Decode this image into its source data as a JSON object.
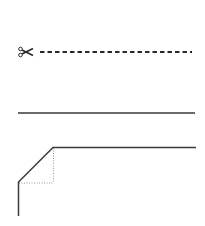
{
  "diagram": {
    "elements": [
      {
        "type": "cut-line",
        "icon": "scissors-icon",
        "style": "dashed"
      },
      {
        "type": "fold-line",
        "style": "solid"
      },
      {
        "type": "corner-bevel",
        "style": "solid",
        "guides": "dotted"
      }
    ],
    "colors": {
      "line": "#2a2a2a",
      "guide": "#9a9a9a",
      "background": "#ffffff"
    }
  }
}
